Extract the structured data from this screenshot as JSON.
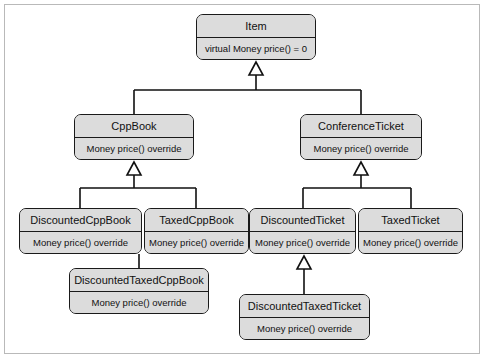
{
  "diagram": {
    "type": "uml-class-diagram",
    "colors": {
      "box_fill": "#dcdcdc",
      "box_border": "#1a1a1a",
      "line": "#111111",
      "frame_border": "#b9b9b9",
      "page_background": "#ffffff"
    },
    "classes": [
      {
        "id": "item",
        "name": "Item",
        "operation": "virtual Money price() = 0",
        "x": 196,
        "y": 14,
        "w": 120,
        "h": 46
      },
      {
        "id": "cppbook",
        "name": "CppBook",
        "operation": "Money price() override",
        "x": 74,
        "y": 114,
        "w": 120,
        "h": 46
      },
      {
        "id": "conferenceticket",
        "name": "ConferenceTicket",
        "operation": "Money price() override",
        "x": 300,
        "y": 114,
        "w": 122,
        "h": 46
      },
      {
        "id": "discountedcppbook",
        "name": "DiscountedCppBook",
        "operation": "Money price() override",
        "x": 19,
        "y": 208,
        "w": 123,
        "h": 46
      },
      {
        "id": "taxedcppbook",
        "name": "TaxedCppBook",
        "operation": "Money price() override",
        "x": 144,
        "y": 208,
        "w": 105,
        "h": 46
      },
      {
        "id": "discountedticket",
        "name": "DiscountedTicket",
        "operation": "Money price() override",
        "x": 249,
        "y": 208,
        "w": 107,
        "h": 46
      },
      {
        "id": "taxedticket",
        "name": "TaxedTicket",
        "operation": "Money price() override",
        "x": 358,
        "y": 208,
        "w": 105,
        "h": 46
      },
      {
        "id": "discountedtaxedcppbook",
        "name": "DiscountedTaxedCppBook",
        "operation": "Money price() override",
        "x": 69,
        "y": 268,
        "w": 140,
        "h": 46
      },
      {
        "id": "discountedtaxedticket",
        "name": "DiscountedTaxedTicket",
        "operation": "Money price() override",
        "x": 239,
        "y": 294,
        "w": 131,
        "h": 46
      }
    ],
    "generalizations": [
      {
        "from": "cppbook",
        "to": "item"
      },
      {
        "from": "conferenceticket",
        "to": "item"
      },
      {
        "from": "discountedcppbook",
        "to": "cppbook"
      },
      {
        "from": "taxedcppbook",
        "to": "cppbook"
      },
      {
        "from": "discountedticket",
        "to": "conferenceticket"
      },
      {
        "from": "taxedticket",
        "to": "conferenceticket"
      },
      {
        "from": "discountedtaxedcppbook",
        "to": "discountedcppbook"
      },
      {
        "from": "discountedtaxedcppbook",
        "to": "taxedcppbook"
      },
      {
        "from": "discountedtaxedticket",
        "to": "discountedticket"
      }
    ]
  }
}
